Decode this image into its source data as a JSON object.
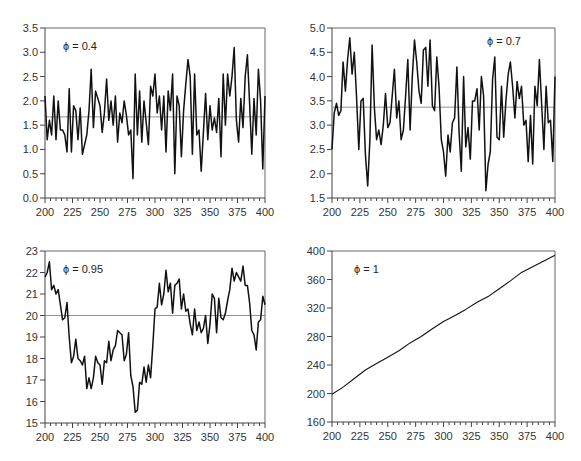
{
  "chart_data": [
    {
      "type": "line",
      "title": "",
      "annotation": "ϕ = 0.4",
      "xlabel": "",
      "ylabel": "",
      "xlim": [
        200,
        400
      ],
      "ylim": [
        0,
        3.5
      ],
      "xticks": [
        200,
        225,
        250,
        275,
        300,
        325,
        350,
        375,
        400
      ],
      "yticks": [
        0.0,
        0.5,
        1.0,
        1.5,
        2.0,
        2.5,
        3.0,
        3.5
      ],
      "ytick_labels": [
        "0.0",
        "0.5",
        "1.0",
        "1.5",
        "2.0",
        "2.5",
        "3.0",
        "3.5"
      ],
      "mean_line": 1.67,
      "frame": {
        "x": 45,
        "y": 28,
        "w": 220,
        "h": 170
      },
      "x": [
        200,
        202,
        204,
        206,
        208,
        210,
        212,
        214,
        216,
        218,
        220,
        222,
        224,
        226,
        228,
        230,
        232,
        234,
        236,
        238,
        240,
        242,
        244,
        246,
        248,
        250,
        252,
        254,
        256,
        258,
        260,
        262,
        264,
        266,
        268,
        270,
        272,
        274,
        276,
        278,
        280,
        282,
        284,
        286,
        288,
        290,
        292,
        294,
        296,
        298,
        300,
        302,
        304,
        306,
        308,
        310,
        312,
        314,
        316,
        318,
        320,
        322,
        324,
        326,
        328,
        330,
        332,
        334,
        336,
        338,
        340,
        342,
        344,
        346,
        348,
        350,
        352,
        354,
        356,
        358,
        360,
        362,
        364,
        366,
        368,
        370,
        372,
        374,
        376,
        378,
        380,
        382,
        384,
        386,
        388,
        390,
        392,
        394,
        396,
        398,
        400
      ],
      "values": [
        2.1,
        1.2,
        1.6,
        1.3,
        2.1,
        1.2,
        2.0,
        1.4,
        1.4,
        1.3,
        0.95,
        2.25,
        0.95,
        1.9,
        1.8,
        1.2,
        1.85,
        0.9,
        1.1,
        1.3,
        1.8,
        2.65,
        1.45,
        2.2,
        2.05,
        1.9,
        1.35,
        1.75,
        2.45,
        1.6,
        2.0,
        1.5,
        2.1,
        1.15,
        1.75,
        1.55,
        2.0,
        1.7,
        1.3,
        1.4,
        0.4,
        2.55,
        1.3,
        2.2,
        1.15,
        2.0,
        1.55,
        1.1,
        2.3,
        2.1,
        2.55,
        1.75,
        2.1,
        1.4,
        2.1,
        0.95,
        2.2,
        1.8,
        2.55,
        0.5,
        2.1,
        1.9,
        0.85,
        1.8,
        2.35,
        2.85,
        2.5,
        0.9,
        2.55,
        1.3,
        1.4,
        0.55,
        1.35,
        2.15,
        1.2,
        1.9,
        1.4,
        1.65,
        1.35,
        2.05,
        0.85,
        2.55,
        1.5,
        2.55,
        2.1,
        2.5,
        3.1,
        1.6,
        1.15,
        2.05,
        1.45,
        2.5,
        2.95,
        1.95,
        0.9,
        2.05,
        1.3,
        2.65,
        2.0,
        0.6,
        2.1
      ]
    },
    {
      "type": "line",
      "title": "",
      "annotation": "ϕ = 0.7",
      "xlabel": "",
      "ylabel": "",
      "xlim": [
        200,
        400
      ],
      "ylim": [
        1.5,
        5.0
      ],
      "xticks": [
        200,
        225,
        250,
        275,
        300,
        325,
        350,
        375,
        400
      ],
      "yticks": [
        1.5,
        2.0,
        2.5,
        3.0,
        3.5,
        4.0,
        4.5,
        5.0
      ],
      "ytick_labels": [
        "1.5",
        "2.0",
        "2.5",
        "3.0",
        "3.5",
        "4.0",
        "4.5",
        "5.0"
      ],
      "mean_line": 3.37,
      "frame": {
        "x": 332,
        "y": 28,
        "w": 223,
        "h": 170
      },
      "x": [
        200,
        202,
        204,
        206,
        208,
        210,
        212,
        214,
        216,
        218,
        220,
        222,
        224,
        226,
        228,
        230,
        232,
        234,
        236,
        238,
        240,
        242,
        244,
        246,
        248,
        250,
        252,
        254,
        256,
        258,
        260,
        262,
        264,
        266,
        268,
        270,
        272,
        274,
        276,
        278,
        280,
        282,
        284,
        286,
        288,
        290,
        292,
        294,
        296,
        298,
        300,
        302,
        304,
        306,
        308,
        310,
        312,
        314,
        316,
        318,
        320,
        322,
        324,
        326,
        328,
        330,
        332,
        334,
        336,
        338,
        340,
        342,
        344,
        346,
        348,
        350,
        352,
        354,
        356,
        358,
        360,
        362,
        364,
        366,
        368,
        370,
        372,
        374,
        376,
        378,
        380,
        382,
        384,
        386,
        388,
        390,
        392,
        394,
        396,
        398,
        400
      ],
      "values": [
        2.5,
        3.25,
        3.45,
        3.2,
        3.3,
        4.3,
        3.7,
        4.35,
        4.8,
        4.05,
        4.5,
        3.6,
        2.5,
        3.5,
        3.55,
        2.4,
        1.75,
        2.7,
        4.65,
        3.35,
        2.7,
        2.9,
        2.6,
        3.0,
        3.65,
        2.95,
        3.05,
        3.6,
        4.15,
        3.15,
        3.5,
        2.7,
        2.9,
        3.6,
        4.35,
        2.9,
        4.0,
        4.75,
        4.3,
        3.7,
        3.45,
        4.55,
        4.6,
        3.8,
        4.75,
        3.4,
        3.3,
        4.4,
        3.8,
        2.7,
        2.45,
        1.95,
        2.8,
        2.45,
        3.05,
        3.15,
        4.2,
        2.85,
        2.05,
        4.0,
        2.55,
        2.95,
        2.3,
        3.5,
        3.5,
        3.75,
        2.9,
        4.0,
        3.6,
        1.65,
        2.2,
        2.45,
        3.95,
        4.4,
        2.75,
        2.7,
        3.8,
        2.75,
        3.5,
        4.05,
        4.3,
        3.8,
        3.15,
        3.9,
        3.55,
        3.8,
        3.0,
        3.1,
        2.25,
        3.2,
        2.2,
        3.8,
        3.4,
        4.35,
        3.45,
        2.5,
        3.8,
        3.05,
        3.1,
        2.25,
        4.0
      ]
    },
    {
      "type": "line",
      "title": "",
      "annotation": "ϕ = 0.95",
      "xlabel": "",
      "ylabel": "",
      "xlim": [
        200,
        400
      ],
      "ylim": [
        15,
        23
      ],
      "xticks": [
        200,
        225,
        250,
        275,
        300,
        325,
        350,
        375,
        400
      ],
      "yticks": [
        15,
        16,
        17,
        18,
        19,
        20,
        21,
        22,
        23
      ],
      "ytick_labels": [
        "15",
        "16",
        "17",
        "18",
        "19",
        "20",
        "21",
        "22",
        "23"
      ],
      "mean_line": 20,
      "frame": {
        "x": 45,
        "y": 251,
        "w": 220,
        "h": 172
      },
      "x": [
        200,
        202,
        204,
        206,
        208,
        210,
        212,
        214,
        216,
        218,
        220,
        222,
        224,
        226,
        228,
        230,
        232,
        234,
        236,
        238,
        240,
        242,
        244,
        246,
        248,
        250,
        252,
        254,
        256,
        258,
        260,
        262,
        264,
        266,
        268,
        270,
        272,
        274,
        276,
        278,
        280,
        282,
        284,
        286,
        288,
        290,
        292,
        294,
        296,
        298,
        300,
        302,
        304,
        306,
        308,
        310,
        312,
        314,
        316,
        318,
        320,
        322,
        324,
        326,
        328,
        330,
        332,
        334,
        336,
        338,
        340,
        342,
        344,
        346,
        348,
        350,
        352,
        354,
        356,
        358,
        360,
        362,
        364,
        366,
        368,
        370,
        372,
        374,
        376,
        378,
        380,
        382,
        384,
        386,
        388,
        390,
        392,
        394,
        396,
        398,
        400
      ],
      "values": [
        21.8,
        22.0,
        22.5,
        21.2,
        21.4,
        21.0,
        21.2,
        20.5,
        19.8,
        19.9,
        20.6,
        19.0,
        17.8,
        18.1,
        18.9,
        18.0,
        17.9,
        17.7,
        18.1,
        16.6,
        17.1,
        16.6,
        17.1,
        18.1,
        17.8,
        17.7,
        16.8,
        17.9,
        17.8,
        18.8,
        17.9,
        18.4,
        18.6,
        19.3,
        19.2,
        19.1,
        17.9,
        18.2,
        19.2,
        17.2,
        16.7,
        15.5,
        15.6,
        16.9,
        16.8,
        17.6,
        16.9,
        17.7,
        17.1,
        18.6,
        20.3,
        20.4,
        21.5,
        20.5,
        21.0,
        22.1,
        21.1,
        21.5,
        20.1,
        21.4,
        21.5,
        21.7,
        20.3,
        21.0,
        20.2,
        20.3,
        19.6,
        19.1,
        20.3,
        19.3,
        19.7,
        19.2,
        19.4,
        20.0,
        18.7,
        19.6,
        21.0,
        20.8,
        19.2,
        20.8,
        19.9,
        19.8,
        20.1,
        20.7,
        21.2,
        22.2,
        21.6,
        22.0,
        21.8,
        21.6,
        22.3,
        21.4,
        21.4,
        20.6,
        19.3,
        19.1,
        18.4,
        19.7,
        19.8,
        20.9,
        20.5
      ]
    },
    {
      "type": "line",
      "title": "",
      "annotation": "ϕ = 1",
      "xlabel": "",
      "ylabel": "",
      "xlim": [
        200,
        400
      ],
      "ylim": [
        160,
        400
      ],
      "xticks": [
        200,
        225,
        250,
        275,
        300,
        325,
        350,
        375,
        400
      ],
      "yticks": [
        160,
        200,
        240,
        280,
        320,
        360,
        400
      ],
      "ytick_labels": [
        "160",
        "200",
        "240",
        "280",
        "320",
        "360",
        "400"
      ],
      "mean_line": null,
      "frame": {
        "x": 332,
        "y": 251,
        "w": 223,
        "h": 171
      },
      "x": [
        200,
        210,
        220,
        230,
        240,
        250,
        260,
        270,
        280,
        290,
        300,
        310,
        320,
        330,
        340,
        350,
        360,
        370,
        380,
        390,
        400
      ],
      "values": [
        199,
        209,
        221,
        233,
        242,
        251,
        260,
        271,
        280,
        291,
        301,
        309,
        318,
        328,
        336,
        347,
        358,
        370,
        378,
        386,
        394
      ]
    }
  ]
}
